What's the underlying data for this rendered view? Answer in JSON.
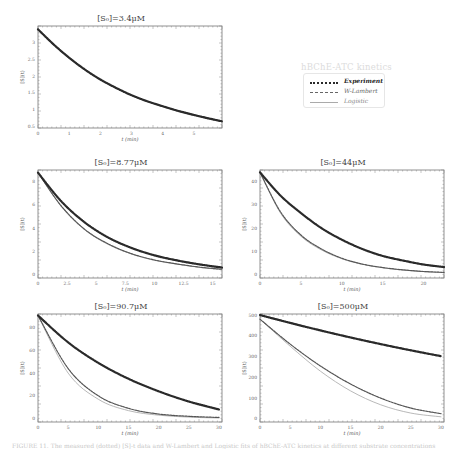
{
  "legend": {
    "title": "hBChE-ATC kinetics",
    "items": [
      {
        "label": "Experiment",
        "style": "dotted-thick",
        "color": "#2a2a2a"
      },
      {
        "label": "W-Lambert",
        "style": "dashed",
        "color": "#666666"
      },
      {
        "label": "Logistic",
        "style": "solid-thin",
        "color": "#aaaaaa"
      }
    ]
  },
  "caption": "FIGURE 11. The measured (dotted) [S]-t data and W-Lambert and Logistic fits of hBChE-ATC kinetics at different substrate concentrations",
  "chart_data": [
    {
      "type": "line",
      "title": "[S0]=3.4μM",
      "xlabel": "t (min)",
      "ylabel": "[S](t)",
      "xlim": [
        0,
        5.9
      ],
      "ylim": [
        0.45,
        3.5
      ],
      "xticks": [
        0,
        1,
        2,
        3,
        4,
        5
      ],
      "yticks": [
        0.5,
        1,
        1.5,
        2,
        2.5,
        3
      ],
      "series": [
        {
          "name": "Experiment",
          "x": [
            0,
            0.5,
            1,
            1.5,
            2,
            2.5,
            3,
            3.5,
            4,
            4.5,
            5,
            5.5,
            5.9
          ],
          "y": [
            3.4,
            2.95,
            2.55,
            2.2,
            1.9,
            1.65,
            1.43,
            1.25,
            1.1,
            0.96,
            0.84,
            0.73,
            0.65
          ]
        },
        {
          "name": "W-Lambert",
          "x": [
            0,
            0.5,
            1,
            1.5,
            2,
            2.5,
            3,
            3.5,
            4,
            4.5,
            5,
            5.5,
            5.9
          ],
          "y": [
            3.4,
            2.95,
            2.55,
            2.2,
            1.9,
            1.65,
            1.43,
            1.25,
            1.1,
            0.96,
            0.84,
            0.73,
            0.65
          ]
        },
        {
          "name": "Logistic",
          "x": [
            0,
            0.5,
            1,
            1.5,
            2,
            2.5,
            3,
            3.5,
            4,
            4.5,
            5,
            5.5,
            5.9
          ],
          "y": [
            3.4,
            2.94,
            2.54,
            2.19,
            1.89,
            1.64,
            1.42,
            1.24,
            1.09,
            0.95,
            0.83,
            0.72,
            0.64
          ]
        }
      ]
    },
    {
      "type": "line",
      "title": "[S0]=8.77μM",
      "xlabel": "t (min)",
      "ylabel": "[S](t)",
      "xlim": [
        0,
        15.8
      ],
      "ylim": [
        -0.3,
        9
      ],
      "xticks": [
        0,
        2.5,
        5,
        7.5,
        10,
        12.5,
        15
      ],
      "yticks": [
        0,
        2,
        4,
        6,
        8
      ],
      "series": [
        {
          "name": "Experiment",
          "x": [
            0,
            2,
            4,
            6,
            8,
            10,
            12,
            14,
            15.8
          ],
          "y": [
            8.77,
            6.3,
            4.5,
            3.2,
            2.3,
            1.65,
            1.2,
            0.85,
            0.6
          ]
        },
        {
          "name": "W-Lambert",
          "x": [
            0,
            2,
            4,
            6,
            8,
            10,
            12,
            14,
            15.8
          ],
          "y": [
            8.77,
            5.9,
            3.9,
            2.65,
            1.8,
            1.25,
            0.9,
            0.62,
            0.45
          ]
        },
        {
          "name": "Logistic",
          "x": [
            0,
            2,
            4,
            6,
            8,
            10,
            12,
            14,
            15.8
          ],
          "y": [
            8.77,
            5.85,
            3.85,
            2.6,
            1.78,
            1.22,
            0.88,
            0.6,
            0.43
          ]
        }
      ]
    },
    {
      "type": "line",
      "title": "[S0]=44μM",
      "xlabel": "t (min)",
      "ylabel": "[S](t)",
      "xlim": [
        0,
        22.5
      ],
      "ylim": [
        -1.5,
        45
      ],
      "xticks": [
        0,
        5,
        10,
        15,
        20
      ],
      "yticks": [
        0,
        10,
        20,
        30,
        40
      ],
      "series": [
        {
          "name": "Experiment",
          "x": [
            0,
            2.5,
            5,
            7.5,
            10,
            12.5,
            15,
            17.5,
            20,
            22.5
          ],
          "y": [
            44,
            34,
            26.5,
            20,
            15,
            11,
            8,
            6,
            4.3,
            3.2
          ]
        },
        {
          "name": "W-Lambert",
          "x": [
            0,
            2.5,
            5,
            7.5,
            10,
            12.5,
            15,
            17.5,
            20,
            22.5
          ],
          "y": [
            44,
            27,
            17,
            11,
            7,
            4.5,
            3,
            2,
            1.3,
            0.9
          ]
        },
        {
          "name": "Logistic",
          "x": [
            0,
            2.5,
            5,
            7.5,
            10,
            12.5,
            15,
            17.5,
            20,
            22.5
          ],
          "y": [
            44,
            26.5,
            16.5,
            10.6,
            6.8,
            4.4,
            2.9,
            1.9,
            1.25,
            0.85
          ]
        }
      ]
    },
    {
      "type": "line",
      "title": "[S0]=90.7μM",
      "xlabel": "t (min)",
      "ylabel": "[S](t)",
      "xlim": [
        0,
        30.5
      ],
      "ylim": [
        -3,
        92
      ],
      "xticks": [
        0,
        5,
        10,
        15,
        20,
        25,
        30
      ],
      "yticks": [
        0,
        20,
        40,
        60,
        80
      ],
      "series": [
        {
          "name": "Experiment",
          "x": [
            0,
            5,
            10,
            15,
            20,
            25,
            30
          ],
          "y": [
            90.7,
            67,
            49,
            35,
            24,
            15,
            8
          ]
        },
        {
          "name": "W-Lambert",
          "x": [
            0,
            5,
            10,
            15,
            20,
            25,
            30
          ],
          "y": [
            90.7,
            44,
            20,
            9,
            4,
            2,
            1
          ]
        },
        {
          "name": "Logistic",
          "x": [
            0,
            5,
            10,
            15,
            20,
            25,
            30
          ],
          "y": [
            90.7,
            40,
            17,
            7,
            3,
            1.3,
            0.5
          ]
        }
      ]
    },
    {
      "type": "line",
      "title": "[S0]=500μM",
      "xlabel": "t (min)",
      "ylabel": "[S](t)",
      "xlim": [
        0,
        30.5
      ],
      "ylim": [
        -15,
        505
      ],
      "xticks": [
        0,
        5,
        10,
        15,
        20,
        25,
        30
      ],
      "yticks": [
        0,
        100,
        200,
        300,
        400,
        500
      ],
      "series": [
        {
          "name": "Experiment",
          "x": [
            0,
            5,
            10,
            15,
            20,
            25,
            30
          ],
          "y": [
            500,
            462,
            426,
            392,
            360,
            330,
            302
          ]
        },
        {
          "name": "W-Lambert",
          "x": [
            0,
            5,
            10,
            15,
            20,
            25,
            30
          ],
          "y": [
            480,
            360,
            255,
            168,
            100,
            52,
            25
          ]
        },
        {
          "name": "Logistic",
          "x": [
            0,
            5,
            10,
            15,
            20,
            25,
            30
          ],
          "y": [
            480,
            350,
            230,
            135,
            68,
            28,
            10
          ]
        }
      ]
    }
  ]
}
